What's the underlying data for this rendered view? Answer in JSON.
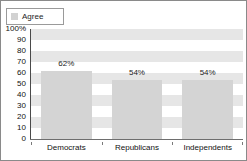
{
  "chart_data": {
    "type": "bar",
    "title": "",
    "subtitle": "",
    "xlabel": "",
    "ylabel": "",
    "categories": [
      "Democrats",
      "Republicans",
      "Independents"
    ],
    "series": [
      {
        "name": "Agree",
        "values": [
          62,
          54,
          54
        ],
        "value_labels": [
          "62%",
          "54%",
          "54%"
        ],
        "color": "#d4d4d4"
      }
    ],
    "ylim": [
      0,
      100
    ],
    "ytick_values": [
      100,
      90,
      80,
      70,
      60,
      50,
      40,
      30,
      20,
      10,
      0
    ],
    "ytick_labels": [
      "100%",
      "90",
      "80",
      "70",
      "60",
      "50",
      "40",
      "30",
      "20",
      "10",
      "0"
    ],
    "grid": "horizontal-bands",
    "band_color": "#e6e6e6",
    "legend_position": "top-left",
    "legend_entries": [
      {
        "label": "Agree",
        "swatch_color": "#d2d2d2"
      }
    ]
  },
  "legend": {
    "entry_label": "Agree"
  },
  "axes": {
    "y_ticks": [
      "100%",
      "90",
      "80",
      "70",
      "60",
      "50",
      "40",
      "30",
      "20",
      "10",
      "0"
    ],
    "x_categories": [
      "Democrats",
      "Republicans",
      "Independents"
    ]
  },
  "bars": {
    "labels": [
      "62%",
      "54%",
      "54%"
    ]
  },
  "colors": {
    "bar_fill": "#d4d4d4",
    "band": "#e6e6e6",
    "frame_border": "#8a8a8a",
    "axis_line": "#4a4a4a",
    "text": "#111111"
  }
}
